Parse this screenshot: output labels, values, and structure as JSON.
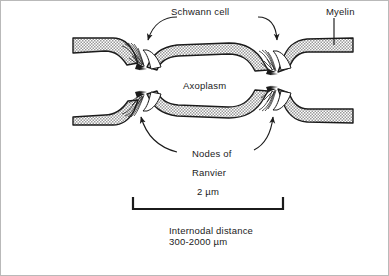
{
  "figure": {
    "type": "biological-diagram",
    "background_color": "#ffffff",
    "border_color": "#b9b9b9",
    "ink_color": "#1b1b1b",
    "myelin_fill_color": "#b5b5b5",
    "axoplasm_fill_color": "#b5b5b5"
  },
  "labels": {
    "schwann_cell": "Schwann cell",
    "myelin": "Myelin",
    "axoplasm": "Axoplasm",
    "nodes_line1": "Nodes of",
    "nodes_line2": "Ranvier",
    "scale_value": "2 µm",
    "internodal_line1": "Internodal distance",
    "internodal_line2": "300-2000 µm"
  },
  "annotations": {
    "schwann_left_arrow": "curved leader arrow to upper-left node",
    "schwann_right_arrow": "curved leader arrow to upper-right node",
    "myelin_pointer": "vertical pointer line to myelin sheath",
    "nodes_left_arrow": "curved leader arrow to lower-left node",
    "nodes_right_arrow": "curved leader arrow to lower-right node"
  },
  "scale_bar": {
    "label": "2 µm",
    "x_start": 131,
    "x_end": 283,
    "y": 208,
    "caption_line1": "Internodal distance",
    "caption_line2": "300-2000 µm"
  }
}
